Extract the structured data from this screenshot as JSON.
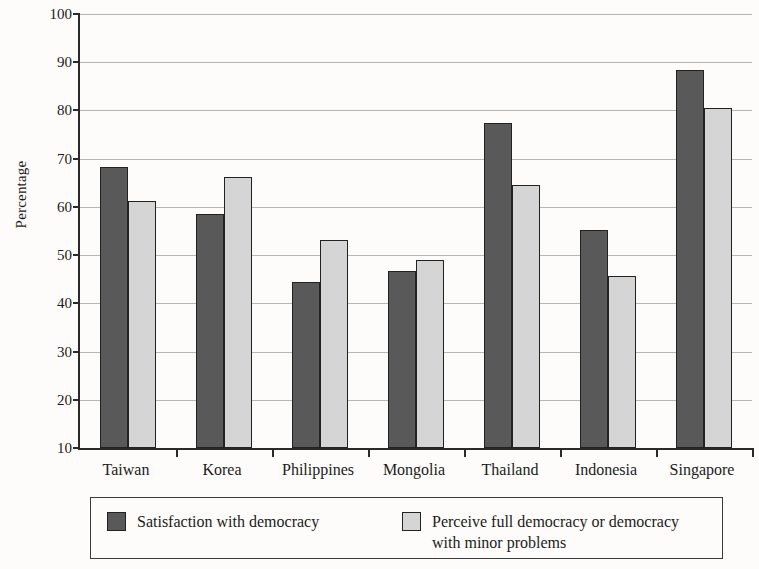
{
  "chart_data": {
    "type": "bar",
    "title": "",
    "subtitle": "",
    "xlabel": "",
    "ylabel": "Percentage",
    "ylim": [
      10,
      100
    ],
    "ytick_labels": [
      "10",
      "20",
      "30",
      "40",
      "50",
      "60",
      "70",
      "80",
      "90",
      "100"
    ],
    "ytick_values": [
      10,
      20,
      30,
      40,
      50,
      60,
      70,
      80,
      90,
      100
    ],
    "grid": true,
    "legend_position": "bottom",
    "categories": [
      "Taiwan",
      "Korea",
      "Philippines",
      "Mongolia",
      "Thailand",
      "Indonesia",
      "Singapore"
    ],
    "series": [
      {
        "name": "Satisfaction with democracy",
        "color": "#595959",
        "values": [
          68.3,
          58.6,
          44.4,
          46.8,
          77.5,
          55.3,
          88.3
        ]
      },
      {
        "name": "Perceive full democracy or democracy with minor problems",
        "color": "#d5d5d5",
        "values": [
          61.2,
          66.2,
          53.2,
          49.0,
          64.5,
          45.7,
          80.5
        ]
      }
    ],
    "legend": [
      {
        "label": "Satisfaction with democracy",
        "color": "#595959"
      },
      {
        "label": "Perceive full democracy or democracy\nwith minor problems",
        "color": "#d5d5d5"
      }
    ]
  },
  "axis": {
    "axis_color": "#2a2a2a",
    "gridline_color": "#b9b6b0"
  }
}
